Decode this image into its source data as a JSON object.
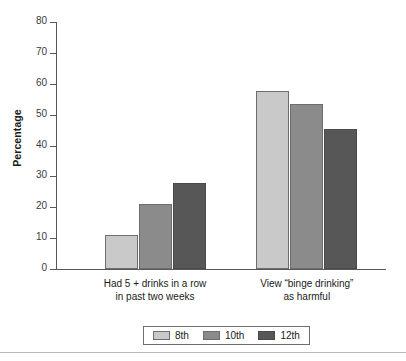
{
  "chart_data": {
    "type": "bar",
    "title": "",
    "subtitle": "",
    "xlabel": "",
    "ylabel": "Percentage",
    "ylim": [
      0,
      80
    ],
    "ytick_step": 10,
    "yticks": [
      "0",
      "10",
      "20",
      "30",
      "40",
      "50",
      "60",
      "70",
      "80"
    ],
    "grid": false,
    "legend_position": "bottom",
    "categories": [
      "Had 5 + drinks in a row\nin past two weeks",
      "View “binge drinking”\nas harmful"
    ],
    "series": [
      {
        "name": "8th",
        "color": "#c9c9c9",
        "values": [
          11,
          57.5
        ]
      },
      {
        "name": "10th",
        "color": "#8b8b8b",
        "values": [
          21,
          53.5
        ]
      },
      {
        "name": "12th",
        "color": "#575757",
        "values": [
          28,
          45.5
        ]
      }
    ]
  },
  "legend": {
    "items": [
      {
        "label": "8th"
      },
      {
        "label": "10th"
      },
      {
        "label": "12th"
      }
    ]
  },
  "axis": {
    "y_title": "Percentage"
  }
}
